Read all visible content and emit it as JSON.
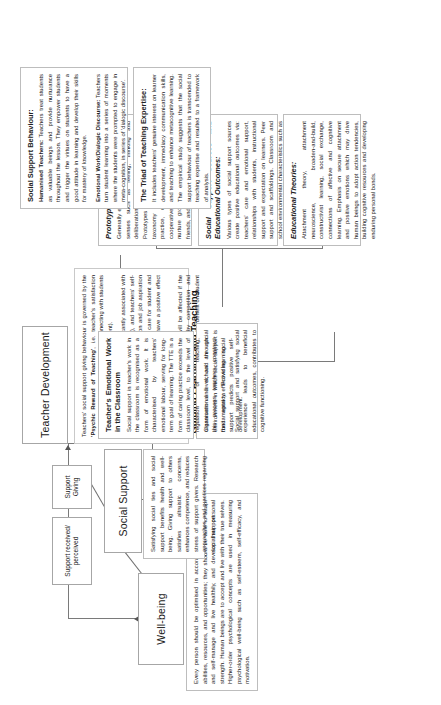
{
  "diagram": {
    "title": "A Meta-theory Guiding Learning and Teaching",
    "orientation": "rotated-90-ccw",
    "colors": {
      "border": "#a6a6a6",
      "text": "#231f20",
      "line": "#7a7a7a"
    }
  },
  "nodes": {
    "teacher_development": "Teacher Development",
    "well_being": "Well-being",
    "social_support": "Social Support",
    "support_giving": "Support\nGiving",
    "support_received": "Support received/\nperceived"
  },
  "center": {
    "line1": "A Meta-theory",
    "line2": "Guiding Learning and Teaching"
  },
  "panels": {
    "teacher_development_text": {
      "p1_pre": "Teachers' social support giving behaviour is governed by the ",
      "p1_bold": "'Psychic Reward of Teaching'",
      "p1_post": ", i.e. teacher's satisfaction derived from spending time with and connecting with students and observe their growth and development).",
      "p2_pre": "Teachers' social support giving is significantly associated with their ",
      "p2_bold": "Self-Efficacy",
      "p2_post": " (feeling competence), and teachers' self-efficacy positively predicts job satisfaction and job aspiration respectively. Opportunities to genuinely care for student and work that support student growth may have a positive effect on ",
      "p2_bold2": "Teacher Development",
      "p2_post2": ".",
      "p3": "In other words, teacher development will be affected if the teaching environment is dominated by competition and examination that shift the focus far from the benefit on student development."
    },
    "well_being_text": {
      "p1": "Every person should be optimised in accordance with their own abilities, resources, and opportunities; they should be able to adapt and self-manage and live healthily, and develop their personal strength. Human beings are to accept and live with their true selves. Higher-order psychological concepts are used in measuring psychological well-being such as self-esteem, self-efficacy, and motivation."
    },
    "social_support_text": {
      "p1": "Satisfying social ties and social support benefits health and well-being. Giving support to others satisfies altruistic concerns, enhances competence, and reduces stress of support givers. Research approaches and practices regarding social support."
    },
    "meta_theory_text": {
      "p1": "Classroom and school are social environment in which social support is fundamental to effective learning.",
      "p2": "Social support and satisfying social experience leads to beneficial educational outcomes, contributes to cognitive functioning."
    },
    "sources_outcomes": {
      "title": "Social Support Sources and Educational Outcomes:",
      "p1": "Various types of social support sources create positive educational outcomes via: teachers' care and emotional support, relationships with students, instructional support and expectation on learners. Peer support and scaffoldings. Classroom and school environmental characteristics such as values and structure."
    },
    "educational_theories": {
      "title": "Educational Theories:",
      "p1": "Attachment theory, attachment neuroscience, broaden-and-build, constructivist learning, social exchange, connections of affective and cognitive learning. Emphasis on secure attachment and positive emotions which may drive human beings to adopt action tendencies, building cognitive resources and developing enduring personal bonds."
    },
    "prototypical_pedagogies": {
      "title": "Prototypical Pedagogies:",
      "p1": "Generally emphasise sensitisation of human senses such as feeling, thinking and deliberation and value individual differences. Prototypes such as affective pedagogy (a taxonomy of affective learning, caring practice, culturally responsive teaching, cooperative learning, formative feedback, nurture groups, circle time and circle of friends, and restorative justice approach."
    },
    "emotional_work": {
      "title": "Teacher's Emotional Work in the Classroom",
      "p1": "Social support in teacher's work in the classroom is recognised as a form of emotional work. It is characterised by teachers' emotional labour, serving for long-term goal of learning. The TTE is a form of caring practice exceeds the classroom level, to the level of regulation of teaching, organisational level, and through this process teachers construct their agency. Providing social support predicts positive self-development."
    },
    "social_support_behaviour": {
      "title": "Social Support Behaviour:",
      "sub1": "Humanised Teachers:",
      "p1": " Teachers treat students as valuable beings and provide nurturance throughout the lesson. They empower students and trigger the virtues on students to have a good attitude in learning and develop their skills for mastery of knowledge.",
      "sub2": "Emotional Work/Dialogic Discourse:",
      "p2": " Teachers turn student learning into a series of moments where the students were prompted to engage in meta-cognition, in series of 'dialogic discourse'."
    },
    "triad_expertise": {
      "title": "The Triad of Teaching Expertise:",
      "p1": "It includes teachers' genuine interest on learner development, immediacy communication skills, and teaching to enhance metacognitive learning. The empirical study suggests that the social support behaviour of teachers is transcended to teaching expertise and resulted to a framework of analysis."
    }
  }
}
